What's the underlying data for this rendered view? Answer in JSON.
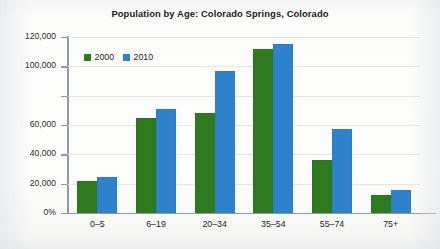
{
  "chart_data": {
    "type": "bar",
    "title": "Population by Age: Colorado Springs, Colorado",
    "xlabel": "",
    "ylabel": "",
    "categories": [
      "0–5",
      "6–19",
      "20–34",
      "35–54",
      "55–74",
      "75+"
    ],
    "series": [
      {
        "name": "2000",
        "color": "#2f7a1f",
        "values": [
          22000,
          65000,
          68000,
          112000,
          36000,
          12000
        ]
      },
      {
        "name": "2010",
        "color": "#2e82cc",
        "values": [
          24500,
          71000,
          96500,
          115000,
          57000,
          15500
        ]
      }
    ],
    "ylim": [
      0,
      120000
    ],
    "ytick_values": [
      0,
      20000,
      40000,
      60000,
      80000,
      100000,
      120000
    ],
    "ytick_labels": [
      "0%",
      "20,000",
      "40,000",
      "60,000",
      "",
      "100,000",
      "120,000"
    ],
    "grid": true,
    "legend_position": "top-left"
  },
  "legend": {
    "items": [
      {
        "label": "2000",
        "color": "#2f7a1f"
      },
      {
        "label": "2010",
        "color": "#2e82cc"
      }
    ]
  }
}
